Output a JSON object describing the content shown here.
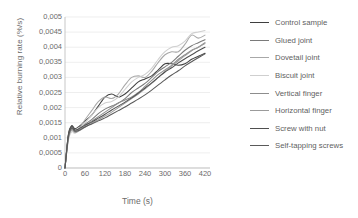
{
  "chart_data": {
    "type": "line",
    "title": "",
    "xlabel": "Time (s)",
    "ylabel": "Relative burning rate (%/s)",
    "xlim": [
      0,
      435
    ],
    "ylim": [
      0,
      0.005
    ],
    "grid": true,
    "legend_position": "right",
    "decimal_separator": ",",
    "x_ticks": [
      0,
      60,
      120,
      180,
      240,
      300,
      360,
      420
    ],
    "x_tick_labels": [
      "0",
      "60",
      "120",
      "180",
      "240",
      "300",
      "360",
      "420"
    ],
    "y_ticks": [
      0,
      0.0005,
      0.001,
      0.0015,
      0.002,
      0.0025,
      0.003,
      0.0035,
      0.004,
      0.0045,
      0.005
    ],
    "y_tick_labels": [
      "0",
      "0,0005",
      "0,001",
      "0,0015",
      "0,002",
      "0,0025",
      "0,003",
      "0,0035",
      "0,004",
      "0,0045",
      "0,005"
    ],
    "x": [
      0,
      10,
      20,
      30,
      45,
      60,
      80,
      100,
      120,
      140,
      160,
      180,
      200,
      220,
      240,
      260,
      280,
      300,
      320,
      340,
      360,
      380,
      400,
      420
    ],
    "series": [
      {
        "name": "Control sample",
        "color": "#3f3f3f",
        "values": [
          0,
          0.0011,
          0.0014,
          0.0013,
          0.0014,
          0.00155,
          0.00175,
          0.00205,
          0.00235,
          0.00245,
          0.00235,
          0.00245,
          0.00265,
          0.00285,
          0.00295,
          0.00305,
          0.00325,
          0.00345,
          0.00345,
          0.0034,
          0.00345,
          0.0036,
          0.0037,
          0.0038
        ]
      },
      {
        "name": "Glued joint",
        "color": "#7a7a7a",
        "values": [
          0,
          0.00105,
          0.00135,
          0.00125,
          0.0013,
          0.00145,
          0.0016,
          0.0018,
          0.00195,
          0.00205,
          0.00215,
          0.0023,
          0.0025,
          0.00265,
          0.0028,
          0.003,
          0.0032,
          0.00335,
          0.0035,
          0.0037,
          0.0039,
          0.00405,
          0.00415,
          0.00425
        ]
      },
      {
        "name": "Dovetail joint",
        "color": "#a8a8a8",
        "values": [
          0,
          0.00095,
          0.00125,
          0.0012,
          0.00135,
          0.0016,
          0.0019,
          0.0022,
          0.00235,
          0.0023,
          0.00245,
          0.00275,
          0.003,
          0.00305,
          0.003,
          0.0032,
          0.0035,
          0.00375,
          0.00385,
          0.00385,
          0.0041,
          0.0044,
          0.0043,
          0.0044
        ]
      },
      {
        "name": "Biscuit joint",
        "color": "#cfcfcf",
        "values": [
          0,
          0.0009,
          0.0012,
          0.00115,
          0.0013,
          0.0015,
          0.00175,
          0.002,
          0.00215,
          0.0022,
          0.00235,
          0.0026,
          0.00285,
          0.003,
          0.0031,
          0.0033,
          0.0036,
          0.00385,
          0.004,
          0.00405,
          0.0042,
          0.00445,
          0.0045,
          0.00455
        ]
      },
      {
        "name": "Vertical finger",
        "color": "#8d8d8d",
        "values": [
          0,
          0.001,
          0.0013,
          0.0012,
          0.00128,
          0.0014,
          0.00155,
          0.0017,
          0.00185,
          0.002,
          0.00215,
          0.00225,
          0.00235,
          0.0025,
          0.0027,
          0.0029,
          0.0031,
          0.00325,
          0.0034,
          0.0036,
          0.00375,
          0.0039,
          0.004,
          0.00415
        ]
      },
      {
        "name": "Horizontal finger",
        "color": "#9b9b9b",
        "values": [
          0,
          0.00098,
          0.00128,
          0.00118,
          0.00125,
          0.00135,
          0.00148,
          0.0016,
          0.00172,
          0.00185,
          0.002,
          0.00215,
          0.0023,
          0.00245,
          0.00262,
          0.0028,
          0.003,
          0.0032,
          0.00338,
          0.00355,
          0.00372,
          0.00388,
          0.004,
          0.00412
        ]
      },
      {
        "name": "Screw with nut",
        "color": "#4f4f4f",
        "values": [
          0,
          0.00108,
          0.00138,
          0.00126,
          0.00132,
          0.00142,
          0.00152,
          0.00165,
          0.00178,
          0.00192,
          0.00205,
          0.00218,
          0.00232,
          0.00248,
          0.00265,
          0.00282,
          0.003,
          0.00318,
          0.00332,
          0.00348,
          0.00362,
          0.00375,
          0.00388,
          0.004
        ]
      },
      {
        "name": "Self-tapping screws",
        "color": "#5a5a5a",
        "values": [
          0,
          0.00102,
          0.00132,
          0.00122,
          0.00126,
          0.00136,
          0.00146,
          0.00156,
          0.00166,
          0.00178,
          0.0019,
          0.00202,
          0.00215,
          0.00228,
          0.00242,
          0.00258,
          0.00275,
          0.00292,
          0.00308,
          0.00322,
          0.00338,
          0.00352,
          0.00365,
          0.00378
        ]
      }
    ]
  }
}
